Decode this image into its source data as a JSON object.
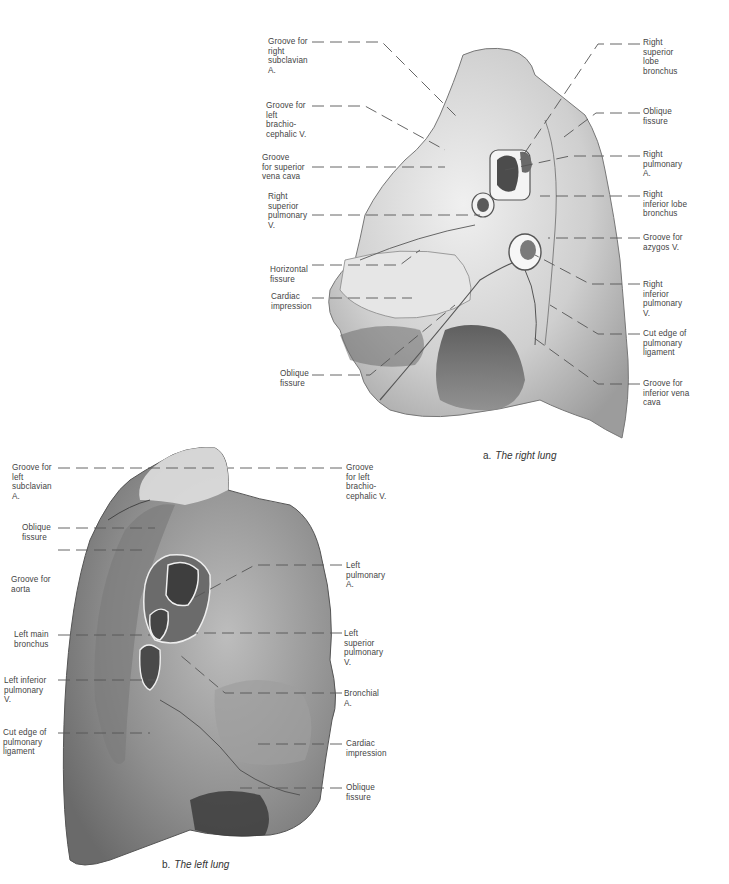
{
  "figure": {
    "panels": [
      {
        "id": "a",
        "caption_letter": "a.",
        "caption_title": "The right lung",
        "labels_left": [
          "Groove for\nright\nsubclavian\nA.",
          "Groove for\nleft\nbrachio-\ncephalic V.",
          "Groove\nfor superior\nvena cava",
          "Right\nsuperior\npulmonary\nV.",
          "Horizontal\nfissure",
          "Cardiac\nimpression",
          "Oblique\nfissure"
        ],
        "labels_right": [
          "Right\nsuperior\nlobe\nbronchus",
          "Oblique\nfissure",
          "Right\npulmonary\nA.",
          "Right\ninferior lobe\nbronchus",
          "Groove for\nazygos V.",
          "Right\ninferior\npulmonary\nV.",
          "Cut edge of\npulmonary\nligament",
          "Groove for\ninferior vena\ncava"
        ]
      },
      {
        "id": "b",
        "caption_letter": "b.",
        "caption_title": "The left lung",
        "labels_left": [
          "Groove for\nleft\nsubclavian\nA.",
          "Oblique\nfissure",
          "Groove for\naorta",
          "Left main\nbronchus",
          "Left inferior\npulmonary\nV.",
          "Cut edge of\npulmonary\nligament"
        ],
        "labels_right": [
          "Groove\nfor left\nbrachio-\ncephalic V.",
          "Left\npulmonary\nA.",
          "Left\nsuperior\npulmonary\nV.",
          "Bronchial\nA.",
          "Cardiac\nimpression",
          "Oblique\nfissure"
        ]
      }
    ],
    "colors": {
      "lung_fill": "#d9d9d9",
      "lung_shade": "#9a9a9a",
      "lung_dark": "#5a5a5a",
      "leader_line": "#555555",
      "text": "#444444"
    }
  }
}
